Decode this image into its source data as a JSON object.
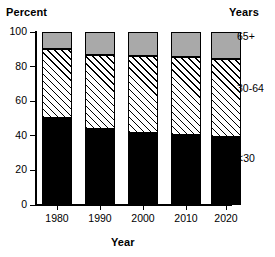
{
  "chart_data": {
    "type": "bar",
    "stacked": true,
    "title": "",
    "xlabel": "Year",
    "ylabel": "Percent",
    "legend_title": "Years",
    "legend_position": "right",
    "grid": false,
    "categories": [
      "1980",
      "1990",
      "2000",
      "2010",
      "2020"
    ],
    "ylim": [
      0,
      100
    ],
    "yticks": [
      0,
      20,
      40,
      60,
      80,
      100
    ],
    "series": [
      {
        "name": "<30",
        "fill": "solid-black",
        "color": "#000000",
        "values": [
          50.3,
          44.0,
          41.6,
          40.5,
          39.3
        ]
      },
      {
        "name": "30-64",
        "fill": "diagonal-hatch",
        "color": "#ffffff",
        "values": [
          39.7,
          42.8,
          44.5,
          45.1,
          45.1
        ]
      },
      {
        "name": "65+",
        "fill": "solid-gray",
        "color": "#a9a9a9",
        "values": [
          10.0,
          13.2,
          13.9,
          14.4,
          15.6
        ]
      }
    ]
  },
  "axes": {
    "y_title": "Percent",
    "x_title": "Year",
    "legend_title": "Years",
    "ytick_labels": [
      "100",
      "80",
      "60",
      "40",
      "20",
      "0"
    ],
    "xtick_labels": [
      "1980",
      "1990",
      "2000",
      "2010",
      "2020"
    ]
  },
  "legend": {
    "items": [
      {
        "label": "65+"
      },
      {
        "label": "30-64"
      },
      {
        "label": "<30"
      }
    ]
  },
  "colors": {
    "old_segment": "#a9a9a9",
    "young_segment": "#000000",
    "mid_segment": "#ffffff",
    "axis": "#000000",
    "background": "#ffffff"
  }
}
